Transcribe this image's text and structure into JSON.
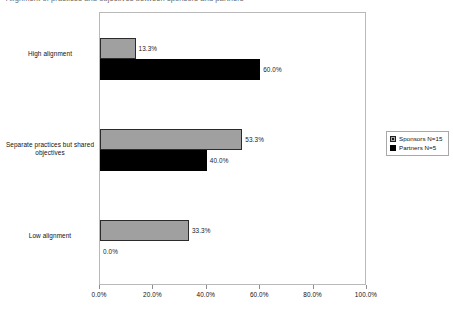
{
  "clipped_title": "Alignment of practices and objectives between sponsors and partners",
  "chart_data": {
    "type": "bar",
    "orientation": "horizontal",
    "title": "",
    "xlabel": "",
    "ylabel": "",
    "xlim": [
      0,
      100
    ],
    "xticks": [
      "0.0%",
      "20.0%",
      "40.0%",
      "60.0%",
      "80.0%",
      "100.0%"
    ],
    "xtick_values": [
      0,
      20,
      40,
      60,
      80,
      100
    ],
    "grid": false,
    "legend_position": "right",
    "categories": [
      "High alignment",
      "Separate practices but shared objectives",
      "Low alignment"
    ],
    "series": [
      {
        "name": "Sponsors N=15",
        "color": "#a0a0a0",
        "values": [
          13.3,
          53.3,
          33.3
        ],
        "labels": [
          "13.3%",
          "53.3%",
          "33.3%"
        ]
      },
      {
        "name": "Partners N=5",
        "color": "#000000",
        "values": [
          60.0,
          40.0,
          0.0
        ],
        "labels": [
          "60.0%",
          "40.0%",
          "0.0%"
        ]
      }
    ]
  },
  "legend": {
    "entries": [
      {
        "label": "Sponsors N=15",
        "swatch": "sponsors"
      },
      {
        "label": "Partners N=5",
        "swatch": "partners"
      }
    ]
  }
}
